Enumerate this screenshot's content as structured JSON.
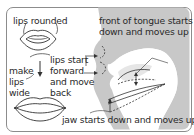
{
  "diagram": {
    "type": "articulation-diagram",
    "labels": {
      "lips_rounded": "lips rounded",
      "make_lips_wide": [
        "make",
        "lips",
        "wide"
      ],
      "lips_movement": [
        "lips start",
        "forward",
        "and move",
        "back"
      ],
      "tongue": [
        "front of tongue starts",
        "down and moves up"
      ],
      "jaw": "jaw starts down and moves up"
    },
    "colors": {
      "border": "#8c8c8c",
      "head_fill": "#c8c8c8",
      "line": "#333333",
      "text": "#2a2a2a"
    }
  }
}
